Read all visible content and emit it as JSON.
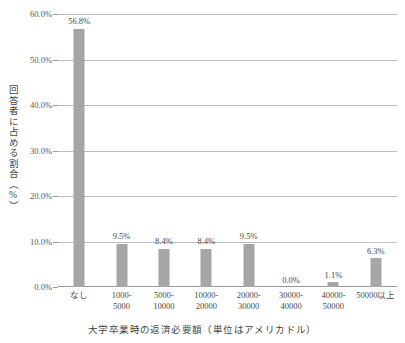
{
  "chart_data": {
    "type": "bar",
    "title": "",
    "xlabel": "大学卒業時の返済必要額（単位はアメリカドル）",
    "ylabel": "回答者に占める割合（%）",
    "categories": [
      "なし",
      "1000-5000",
      "5000-10000",
      "10000-20000",
      "20000-30000",
      "30000-40000",
      "40000-50000",
      "50000以上"
    ],
    "category_lines": [
      [
        "なし",
        ""
      ],
      [
        "1000-",
        "5000"
      ],
      [
        "5000-",
        "10000"
      ],
      [
        "10000-",
        "20000"
      ],
      [
        "20000-",
        "30000"
      ],
      [
        "30000-",
        "40000"
      ],
      [
        "40000-",
        "50000"
      ],
      [
        "50000以上",
        ""
      ]
    ],
    "values": [
      56.8,
      9.5,
      8.4,
      8.4,
      9.5,
      0.0,
      1.1,
      6.3
    ],
    "value_labels": [
      "56.8%",
      "9.5%",
      "8.4%",
      "8.4%",
      "9.5%",
      "0.0%",
      "1.1%",
      "6.3%"
    ],
    "ylim": [
      0,
      60
    ],
    "ytick_values": [
      0,
      10,
      20,
      30,
      40,
      50,
      60
    ],
    "ytick_labels": [
      "0.0%",
      "10.0%",
      "20.0%",
      "30.0%",
      "40.0%",
      "50.0%",
      "60.0%"
    ],
    "grid": true,
    "legend": "none",
    "bar_color": "#a6a6a6",
    "gridline_color": "#bdbdbd",
    "axis_color": "#9a9a9a",
    "text_color": "#4a4a4a"
  }
}
